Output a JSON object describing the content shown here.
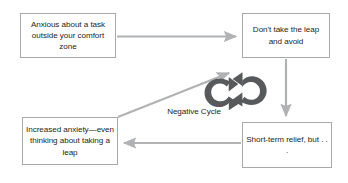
{
  "diagram": {
    "title": "Negative Cycle",
    "colors": {
      "box_border": "#a7a9ab",
      "arrow": "#b0b2b4",
      "cycle_icon": "#58595b",
      "text": "#231f20",
      "background": "#ffffff"
    },
    "nodes": [
      {
        "id": "anxious",
        "label": "Anxious about a task outside your comfort zone"
      },
      {
        "id": "avoid",
        "label": "Don't take the leap and avoid"
      },
      {
        "id": "relief",
        "label": "Short-term relief, but . . ."
      },
      {
        "id": "increased",
        "label": "Increased anxiety—even thinking about taking a leap"
      }
    ],
    "center_label": "Negative Cycle",
    "center_icon": "cycle-arrows-icon",
    "edges": [
      {
        "id": "anxious-to-avoid",
        "from": "anxious",
        "to": "avoid",
        "direction": "right"
      },
      {
        "id": "avoid-to-relief",
        "from": "avoid",
        "to": "relief",
        "direction": "down"
      },
      {
        "id": "relief-to-increased",
        "from": "relief",
        "to": "increased",
        "direction": "left"
      },
      {
        "id": "increased-to-avoid",
        "from": "increased",
        "to": "avoid",
        "direction": "diagonal-up-right"
      }
    ]
  }
}
